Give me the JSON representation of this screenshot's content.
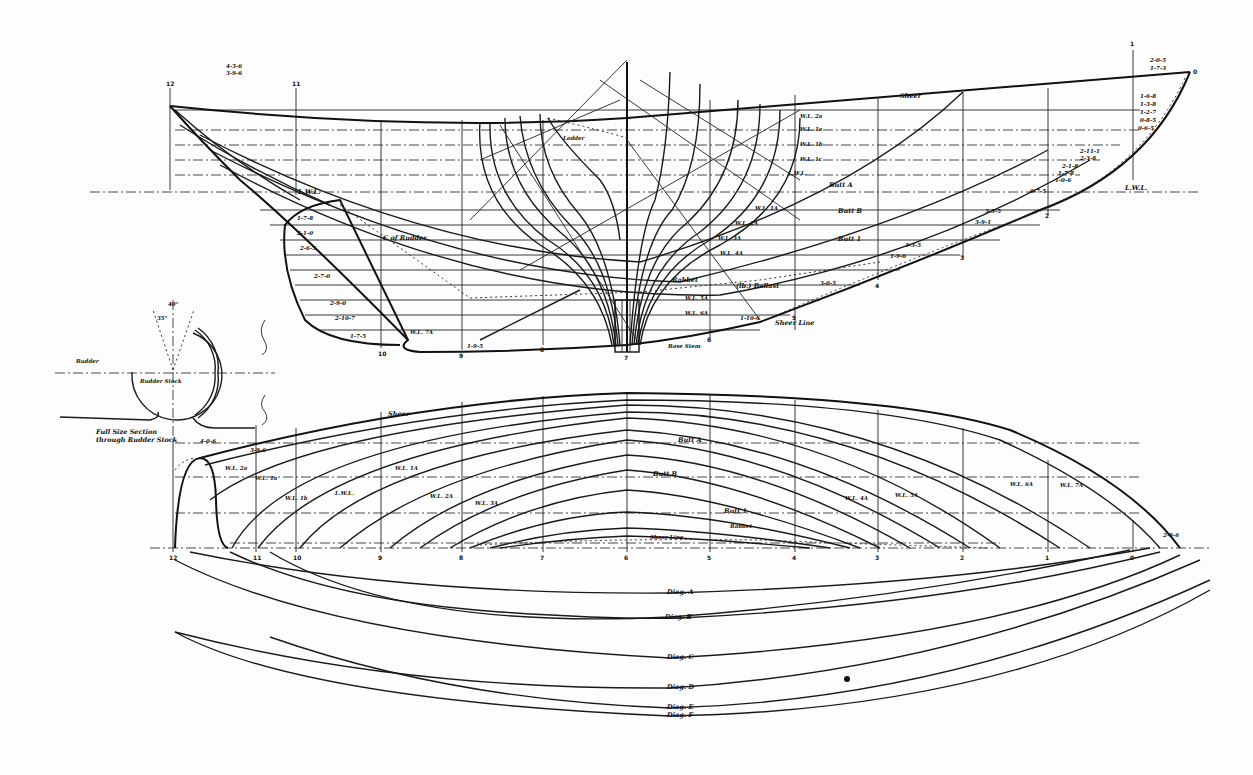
{
  "drawing": {
    "title": "Lines Plan",
    "views": [
      "profile",
      "body_plan",
      "half_breadth",
      "diagonals",
      "rudder_section"
    ]
  },
  "profile": {
    "labels": {
      "sheer": "Sheer",
      "lwl_aft": "L.W.L.",
      "lwl_fwd": "L.W.L.",
      "buttock_a": "Butt A",
      "buttock_b": "Butt B",
      "buttock_1": "Butt 1",
      "rabbet": "Rabbet",
      "sheer_line": "Sheer Line",
      "ballast": "(lb.) Ballast",
      "c_of_rudder": "C of Rudder",
      "ladder": "Ladder",
      "base": "Base Stem"
    },
    "waterlines": [
      "W.L. 2a",
      "W.L. 1a",
      "W.L. 1b",
      "W.L. 1c",
      "L.W.L.",
      "W.L. 1A",
      "W.L. 2A",
      "W.L. 3A",
      "W.L. 4A",
      "W.L. 5A",
      "W.L. 6A",
      "W.L. 7A"
    ],
    "offsets_aft": [
      "4-3-6",
      "3-9-6",
      "1-7-8",
      "2-1-0",
      "2-6-5",
      "2-7-0",
      "2-9-0",
      "2-10-7",
      "1-7-5",
      "1-9-5",
      "1-10-6"
    ],
    "offsets_fwd": [
      "2-0-5",
      "1-7-3",
      "1-6-8",
      "1-3-8",
      "1-2-7",
      "0-8-5",
      "0-6-5",
      "2-11-1",
      "2-3-8",
      "2-1-8",
      "1-7-8",
      "1-0-6",
      "0-7-5",
      "3-5-5",
      "3-3-5",
      "3-9-1",
      "1-9-6",
      "3-0-5"
    ],
    "stations": [
      "12",
      "11",
      "10",
      "9",
      "8",
      "7",
      "6",
      "5",
      "4",
      "3",
      "2",
      "1",
      "0"
    ]
  },
  "half_breadth": {
    "labels": {
      "sheer": "Sheer",
      "buttock_a": "Butt A",
      "buttock_b": "Butt B",
      "buttock_1": "Butt 1",
      "rabbet": "Rabbet",
      "sheer_line": "Sheer Line",
      "offset_aft": "4-0-6",
      "offset_aft2": "3-9-6",
      "offset_fwd": "2-9-6"
    },
    "waterlines": [
      "W.L. 2a",
      "W.L. 1a",
      "W.L. 1b",
      "L.W.L.",
      "W.L. 1A",
      "W.L. 2A",
      "W.L. 3A",
      "W.L. 4A",
      "W.L. 5A",
      "W.L. 6A",
      "W.L. 7A"
    ],
    "stations": [
      "12",
      "11",
      "10",
      "9",
      "8",
      "7",
      "6",
      "5",
      "4",
      "3",
      "2",
      "1",
      "0"
    ]
  },
  "diagonals": {
    "labels": [
      "Diag. A",
      "Diag. B",
      "Diag. C",
      "Diag. D",
      "Diag. E",
      "Diag. F"
    ]
  },
  "rudder_section": {
    "caption_line1": "Full Size Section",
    "caption_line2": "through Rudder Stock",
    "rudder_label": "Rudder",
    "stock_label": "Rudder Stock",
    "angle_1": "40°",
    "angle_2": "35°"
  },
  "colors": {
    "ink": "#1a1a1a",
    "paper": "#fdfdfd"
  }
}
